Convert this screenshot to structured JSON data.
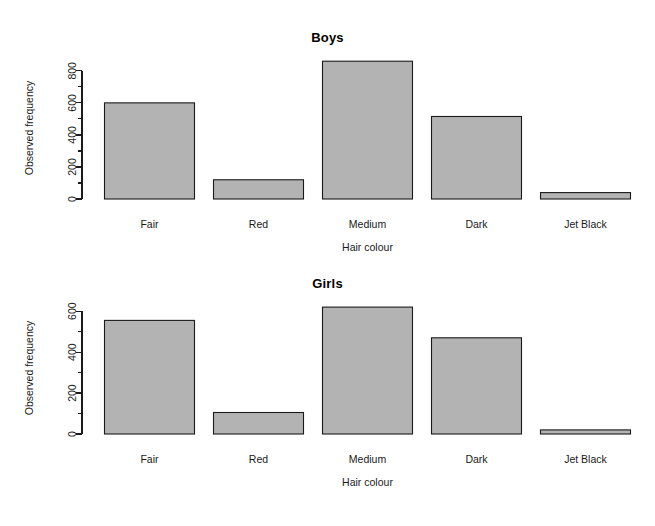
{
  "figure": {
    "background": "#ffffff",
    "bar_fill": "#b3b3b3",
    "bar_stroke": "#1a1a1a",
    "axis_color": "#1a1a1a"
  },
  "panels": [
    {
      "id": "boys",
      "title": "Boys",
      "ylabel": "Observed frequency",
      "xlabel": "Hair colour",
      "ytick_labels": [
        "0",
        "200",
        "400",
        "600",
        "800"
      ],
      "xtick_labels": [
        "Fair",
        "Red",
        "Medium",
        "Dark",
        "Jet Black"
      ]
    },
    {
      "id": "girls",
      "title": "Girls",
      "ylabel": "Observed frequency",
      "xlabel": "Hair colour",
      "ytick_labels": [
        "0",
        "200",
        "400",
        "600"
      ],
      "xtick_labels": [
        "Fair",
        "Red",
        "Medium",
        "Dark",
        "Jet Black"
      ]
    }
  ],
  "chart_data": [
    {
      "type": "bar",
      "id": "boys",
      "title": "Boys",
      "xlabel": "Hair colour",
      "ylabel": "Observed frequency",
      "categories": [
        "Fair",
        "Red",
        "Medium",
        "Dark",
        "Jet Black"
      ],
      "values": [
        600,
        120,
        860,
        515,
        40
      ],
      "ylim": [
        0,
        880
      ],
      "yticks": [
        0,
        200,
        400,
        600,
        800
      ],
      "yminorticks": [
        100,
        300,
        500,
        700
      ],
      "grid": false,
      "legend": "none"
    },
    {
      "type": "bar",
      "id": "girls",
      "title": "Girls",
      "xlabel": "Hair colour",
      "ylabel": "Observed frequency",
      "categories": [
        "Fair",
        "Red",
        "Medium",
        "Dark",
        "Jet Black"
      ],
      "values": [
        555,
        105,
        620,
        470,
        20
      ],
      "ylim": [
        0,
        640
      ],
      "yticks": [
        0,
        200,
        400,
        600
      ],
      "yminorticks": [
        100,
        300,
        500
      ],
      "grid": false,
      "legend": "none"
    }
  ]
}
